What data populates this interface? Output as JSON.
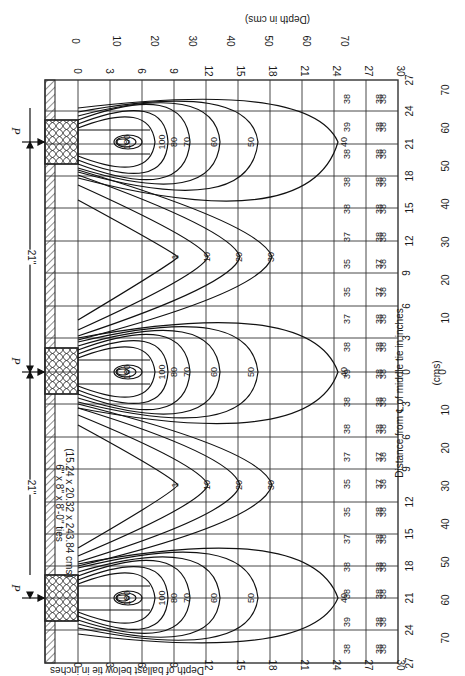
{
  "diagram": {
    "orientation": "rotated 90deg clockwise",
    "tie_label_line1": "6\" x 8\" x 8'-0\" ties",
    "tie_label_line2": "(15.24 x 20.32 x 243.84 cms)",
    "load_label": "P",
    "spacing_label_1": "21\"",
    "spacing_label_2": "21\"",
    "depth_axis_inches": {
      "title": "Depth of ballast below tie in inches",
      "ticks": [
        "0",
        "3",
        "6",
        "9",
        "12",
        "15",
        "18",
        "21",
        "24",
        "27",
        "30"
      ]
    },
    "depth_axis_cms": {
      "title": "(Depth in cms)",
      "ticks": [
        "0",
        "10",
        "20",
        "30",
        "40",
        "50",
        "60",
        "70"
      ]
    },
    "distance_axis_inches": {
      "title": "Distance from ℄ of middle tie in inches",
      "ticks": [
        "27",
        "24",
        "21",
        "18",
        "15",
        "12",
        "9",
        "6",
        "3",
        "0",
        "3",
        "6",
        "9",
        "12",
        "15",
        "18",
        "21",
        "24",
        "27"
      ]
    },
    "distance_axis_cms": {
      "title": "(cms)",
      "ticks": [
        "70",
        "60",
        "50",
        "40",
        "30",
        "20",
        "10",
        "0",
        "10",
        "20",
        "30",
        "40",
        "50",
        "60",
        "70"
      ]
    },
    "contour_labels": [
      "180",
      "100",
      "80",
      "70",
      "60",
      "50",
      "40",
      "30",
      "20",
      "10",
      "1"
    ],
    "row_values": {
      "depth_21_to_24": [
        "38",
        "39",
        "38",
        "38",
        "38",
        "37",
        "35",
        "35",
        "37",
        "38",
        "39",
        "38",
        "38",
        "37",
        "35",
        "35",
        "37",
        "38",
        "38",
        "39",
        "38"
      ],
      "depth_24_to_27": [
        "38",
        "38",
        "38",
        "38",
        "38",
        "38",
        "37",
        "37",
        "38",
        "38",
        "38",
        "38",
        "38",
        "37",
        "37",
        "38",
        "38",
        "38",
        "38",
        "38",
        "38"
      ],
      "depth_27_to_30": [
        "38",
        "38",
        "38",
        "38",
        "38",
        "38",
        "38",
        "38",
        "38",
        "38",
        "38",
        "38",
        "38",
        "38",
        "38",
        "38",
        "38",
        "38",
        "38",
        "38",
        "38"
      ]
    }
  }
}
